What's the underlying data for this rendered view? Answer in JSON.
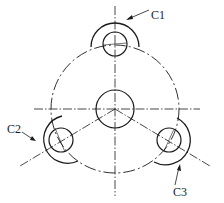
{
  "diagram": {
    "type": "mechanical-drawing",
    "center": {
      "x": 115,
      "y": 109,
      "radius": 19
    },
    "pitch_circle_radius": 64,
    "holes": [
      {
        "id": "C1",
        "x": 115,
        "y": 44,
        "hole_radius": 12,
        "arc_radius": 24
      },
      {
        "id": "C2",
        "x": 60,
        "y": 140,
        "hole_radius": 12,
        "arc_radius": 24
      },
      {
        "id": "C3",
        "x": 169,
        "y": 140,
        "hole_radius": 12,
        "arc_radius": 24
      }
    ],
    "labels": [
      {
        "text": "C1",
        "x": 151,
        "y": 9
      },
      {
        "text": "C2",
        "x": 7,
        "y": 123
      },
      {
        "text": "C3",
        "x": 173,
        "y": 186
      }
    ],
    "colors": {
      "line": "#1a1a1a",
      "background": "#ffffff"
    }
  }
}
